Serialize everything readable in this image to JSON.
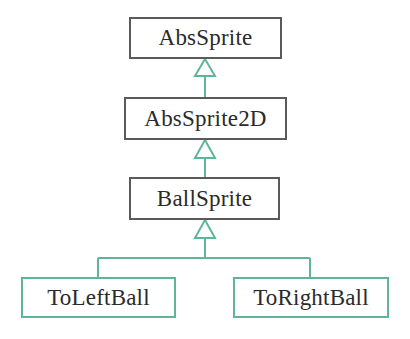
{
  "diagram": {
    "type": "UML class inheritance hierarchy",
    "classes": [
      {
        "name": "AbsSprite"
      },
      {
        "name": "AbsSprite2D"
      },
      {
        "name": "BallSprite"
      },
      {
        "name": "ToLeftBall"
      },
      {
        "name": "ToRightBall"
      }
    ],
    "relations": [
      {
        "from": "AbsSprite2D",
        "to": "AbsSprite",
        "kind": "generalization"
      },
      {
        "from": "BallSprite",
        "to": "AbsSprite2D",
        "kind": "generalization"
      },
      {
        "from": "ToLeftBall",
        "to": "BallSprite",
        "kind": "generalization"
      },
      {
        "from": "ToRightBall",
        "to": "BallSprite",
        "kind": "generalization"
      }
    ],
    "colors": {
      "box_border": "#5a5a5a",
      "leaf_border": "#5fb59a",
      "connector": "#5fb59a",
      "text": "#2a2a2a"
    }
  }
}
